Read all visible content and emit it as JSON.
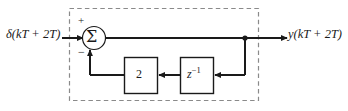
{
  "figure": {
    "kind": "block-diagram"
  },
  "signals": {
    "input_label": "δ(kT + 2T)",
    "output_label": "y(kT + 2T)"
  },
  "summing_junction": {
    "symbol": "Σ",
    "input_sign_top": "+",
    "input_sign_bottom": "−"
  },
  "blocks": [
    {
      "name": "gain-block",
      "label": "2"
    },
    {
      "name": "delay-block",
      "label_base": "z",
      "label_exponent": "−1"
    }
  ],
  "colors": {
    "line": "#1a1a1a",
    "dashed_border": "#8a8a8a",
    "background": "#ffffff",
    "block_fill": "#ffffff"
  }
}
